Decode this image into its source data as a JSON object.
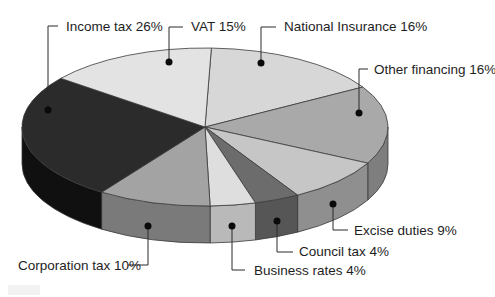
{
  "chart_data": {
    "type": "pie",
    "style": "3d-tilted",
    "title": "",
    "unit": "%",
    "start_angle_deg": 2,
    "categories": [
      "National Insurance",
      "Other financing",
      "Excise duties",
      "Council tax",
      "Business rates",
      "Corporation tax",
      "Income tax",
      "VAT"
    ],
    "values": [
      16,
      16,
      9,
      4,
      4,
      10,
      26,
      15
    ],
    "slices": [
      {
        "name": "National Insurance",
        "value": 16,
        "label": "National Insurance 16%",
        "color": "#d7d7d7",
        "side": "#bdbdbd"
      },
      {
        "name": "Other financing",
        "value": 16,
        "label": "Other financing 16%",
        "color": "#a9a9a9",
        "side": "#7e7e7e"
      },
      {
        "name": "Excise duties",
        "value": 9,
        "label": "Excise duties 9%",
        "color": "#c6c6c6",
        "side": "#8f8f8f"
      },
      {
        "name": "Council tax",
        "value": 4,
        "label": "Council tax 4%",
        "color": "#6c6c6c",
        "side": "#565656"
      },
      {
        "name": "Business rates",
        "value": 4,
        "label": "Business rates 4%",
        "color": "#dedede",
        "side": "#b9b9b9"
      },
      {
        "name": "Corporation tax",
        "value": 10,
        "label": "Corporation tax 10%",
        "color": "#a3a3a3",
        "side": "#7a7a7a"
      },
      {
        "name": "Income tax",
        "value": 26,
        "label": "Income tax 26%",
        "color": "#2b2b2b",
        "side": "#101010"
      },
      {
        "name": "VAT",
        "value": 15,
        "label": "VAT 15%",
        "color": "#e3e3e3",
        "side": "#c9c9c9"
      }
    ],
    "legend": "none (leader-line labels)"
  },
  "labels": {
    "income_tax": "Income tax 26%",
    "vat": "VAT 15%",
    "national_insurance": "National Insurance 16%",
    "other_financing": "Other financing 16%",
    "excise_duties": "Excise duties 9%",
    "council_tax": "Council tax 4%",
    "business_rates": "Business rates 4%",
    "corporation_tax": "Corporation tax 10%"
  },
  "colors": {
    "outline": "#3a3a3a",
    "text": "#1e1e1e",
    "background": "#ffffff"
  }
}
